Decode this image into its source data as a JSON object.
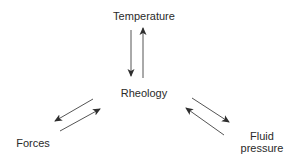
{
  "diagram": {
    "nodes": {
      "temperature": "Temperature",
      "rheology": "Rheology",
      "forces": "Forces",
      "fluid_line1": "Fluid",
      "fluid_line2": "pressure"
    },
    "edges": [
      {
        "from": "Temperature",
        "to": "Rheology"
      },
      {
        "from": "Rheology",
        "to": "Temperature"
      },
      {
        "from": "Rheology",
        "to": "Forces"
      },
      {
        "from": "Forces",
        "to": "Rheology"
      },
      {
        "from": "Rheology",
        "to": "Fluid pressure"
      },
      {
        "from": "Fluid pressure",
        "to": "Rheology"
      }
    ],
    "colors": {
      "arrow": "#3a3a3a",
      "text": "#2a2a2a",
      "background": "#ffffff"
    }
  }
}
